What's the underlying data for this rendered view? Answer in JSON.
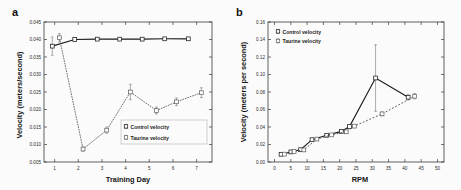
{
  "figure": {
    "background": "#fbfbfb",
    "panel_a_label": "a",
    "panel_b_label": "b"
  },
  "chart_data": [
    {
      "panel": "a",
      "type": "line",
      "title": "",
      "xlabel": "Training Day",
      "ylabel": "Velocity (meters/second)",
      "xlim": [
        0.55,
        7.65
      ],
      "ylim": [
        0.005,
        0.045
      ],
      "xticks": [
        1,
        2,
        3,
        4,
        5,
        6,
        7
      ],
      "xticklabels": [
        "1",
        "2",
        "3",
        "4",
        "5",
        "6",
        "7"
      ],
      "yticks": [
        0.005,
        0.01,
        0.015,
        0.02,
        0.025,
        0.03,
        0.035,
        0.04,
        0.045
      ],
      "yticklabels": [
        "0.005",
        "0.010",
        "0.015",
        "0.020",
        "0.025",
        "0.030",
        "0.035",
        "0.040",
        "0.045"
      ],
      "grid": false,
      "legend_position": "lower-right",
      "series": [
        {
          "name": "Control velocity",
          "style": "solid",
          "marker": "square",
          "x": [
            0.9,
            1.85,
            2.8,
            3.75,
            4.7,
            5.65,
            6.65
          ],
          "values": [
            0.0381,
            0.04,
            0.0401,
            0.0401,
            0.0401,
            0.0402,
            0.0402
          ],
          "errors": [
            0.0026,
            0.0004,
            0.0003,
            0.0003,
            0.0003,
            0.0003,
            0.0003
          ]
        },
        {
          "name": "Taurine velocity",
          "style": "dotted",
          "marker": "square",
          "x": [
            1.2,
            2.2,
            3.2,
            4.2,
            5.3,
            6.15,
            7.2
          ],
          "values": [
            0.0405,
            0.0087,
            0.0141,
            0.025,
            0.0197,
            0.0222,
            0.0248
          ],
          "errors": [
            0.0012,
            0.0006,
            0.0009,
            0.0022,
            0.001,
            0.0011,
            0.0014
          ]
        }
      ]
    },
    {
      "panel": "b",
      "type": "line",
      "title": "",
      "xlabel": "RPM",
      "ylabel": "Velocity (meters per second)",
      "xlim": [
        -2,
        52
      ],
      "ylim": [
        0.0,
        0.16
      ],
      "xticks": [
        0,
        5,
        10,
        15,
        20,
        25,
        30,
        35,
        40,
        45,
        50
      ],
      "xticklabels": [
        "0",
        "5",
        "10",
        "15",
        "20",
        "25",
        "30",
        "35",
        "40",
        "45",
        "50"
      ],
      "yticks": [
        0.0,
        0.02,
        0.04,
        0.06,
        0.08,
        0.1,
        0.12,
        0.14,
        0.16
      ],
      "yticklabels": [
        "0.00",
        "0.02",
        "0.04",
        "0.06",
        "0.08",
        "0.10",
        "0.12",
        "0.14",
        "0.16"
      ],
      "grid": false,
      "legend_position": "upper-left",
      "series": [
        {
          "name": "Control velocity",
          "style": "solid",
          "marker": "square",
          "x": [
            2.0,
            5.0,
            8.0,
            11.5,
            16.0,
            20.5,
            23.0,
            31.0,
            41.0
          ],
          "values": [
            0.0088,
            0.0115,
            0.014,
            0.0255,
            0.0305,
            0.035,
            0.0405,
            0.096,
            0.074
          ],
          "errors": [
            0.0008,
            0.0008,
            0.001,
            0.0012,
            0.0012,
            0.0014,
            0.0018,
            0.038,
            0.003
          ]
        },
        {
          "name": "Taurine velocity",
          "style": "dashed",
          "marker": "square",
          "x": [
            3.0,
            6.0,
            9.0,
            13.0,
            17.5,
            22.0,
            24.5,
            33.0,
            43.0
          ],
          "values": [
            0.009,
            0.012,
            0.0138,
            0.0262,
            0.031,
            0.0345,
            0.041,
            0.055,
            0.0752
          ],
          "errors": [
            0.0008,
            0.0008,
            0.001,
            0.0012,
            0.0012,
            0.0014,
            0.0016,
            0.0022,
            0.003
          ]
        }
      ]
    }
  ]
}
